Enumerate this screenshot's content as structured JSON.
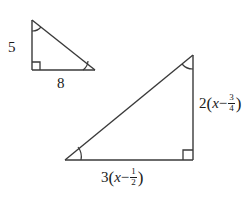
{
  "figure": {
    "kind": "similar-right-triangles-diagram",
    "background_color": "#ffffff",
    "stroke_color": "#3a3a3a",
    "text_color": "#1a1a1a",
    "small_triangle": {
      "name": "small-right-triangle",
      "vertical_leg_label": "5",
      "horizontal_leg_label": "8",
      "right_angle_vertex": "bottom-left",
      "marked_angles": [
        "top",
        "bottom-right"
      ]
    },
    "large_triangle": {
      "name": "large-right-triangle",
      "vertical_leg_label": {
        "coefficient": "2",
        "open_paren": "(",
        "variable": "x",
        "operator": "−",
        "fraction_numerator": "3",
        "fraction_denominator": "4",
        "close_paren": ")",
        "plain": "2(x − 3/4)"
      },
      "horizontal_leg_label": {
        "coefficient": "3",
        "open_paren": "(",
        "variable": "x",
        "operator": "−",
        "fraction_numerator": "1",
        "fraction_denominator": "2",
        "close_paren": ")",
        "plain": "3(x − 1/2)"
      },
      "right_angle_vertex": "bottom-right",
      "marked_angles": [
        "top",
        "bottom-left"
      ]
    }
  }
}
